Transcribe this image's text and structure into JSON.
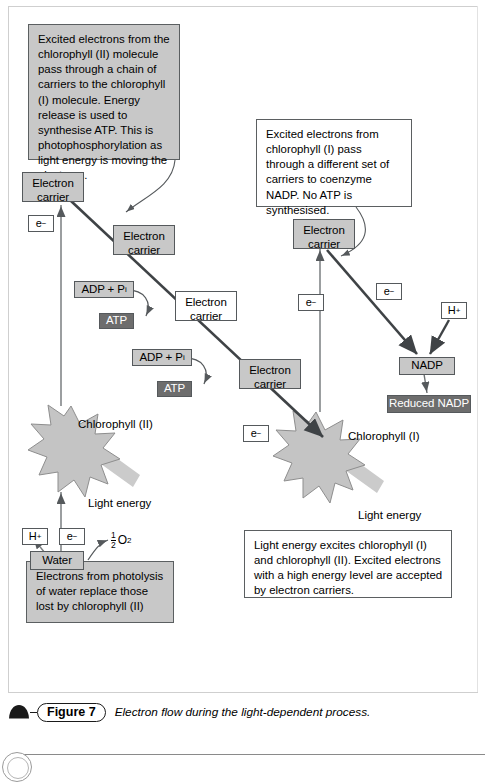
{
  "figure": {
    "number_label": "Figure 7",
    "caption": "Electron flow during the light-dependent process.",
    "icon": "arch-triangle-icon"
  },
  "notes": [
    {
      "id": "note-chlorophyll-2",
      "text": "Excited electrons from the chlorophyll (II) molecule pass through a chain of carriers to the chlorophyll (I) molecule. Energy release is used to synthesise ATP. This is photophosphorylation as light energy is moving the electrons.",
      "style": "gray"
    },
    {
      "id": "note-chlorophyll-1",
      "text": "Excited electrons from chlorophyll (I) pass through a different set of carriers to coenzyme NADP. No ATP is synthesised.",
      "style": "white"
    },
    {
      "id": "note-photolysis",
      "text": "Electrons from photolysis of water replace those lost by chlorophyll (II)",
      "style": "gray"
    },
    {
      "id": "note-light-energy",
      "text": "Light energy excites chlorophyll (I) and chlorophyll (II). Excited electrons with a high energy level are accepted by electron carriers.",
      "style": "white"
    }
  ],
  "carriers": [
    {
      "id": "carrier-left-top",
      "line1": "Electron",
      "line2": "carrier",
      "style": "gray"
    },
    {
      "id": "carrier-left-mid",
      "line1": "Electron",
      "line2": "carrier",
      "style": "gray"
    },
    {
      "id": "carrier-center-mid",
      "line1": "Electron",
      "line2": "carrier",
      "style": "white"
    },
    {
      "id": "carrier-center-low",
      "line1": "Electron",
      "line2": "carrier",
      "style": "gray"
    },
    {
      "id": "carrier-right-top",
      "line1": "Electron",
      "line2": "carrier",
      "style": "gray"
    }
  ],
  "molecules": {
    "adp_pi_upper": "ADP + P",
    "adp_pi_upper_sub": "i",
    "adp_pi_lower": "ADP + P",
    "adp_pi_lower_sub": "i",
    "atp_upper": "ATP",
    "atp_lower": "ATP",
    "nadp": "NADP",
    "reduced_nadp": "Reduced NADP",
    "water": "Water"
  },
  "ions": {
    "electron": "e",
    "electron_sup": "−",
    "proton": "H",
    "proton_sup": "+",
    "oxygen_num": "1",
    "oxygen_den": "2",
    "oxygen": "O",
    "oxygen_sub": "2"
  },
  "labels": {
    "chlorophyll_2": "Chlorophyll (II)",
    "chlorophyll_1": "Chlorophyll (I)",
    "light_energy_left": "Light energy",
    "light_energy_right": "Light energy"
  },
  "colors": {
    "box_gray": "#c8c8c8",
    "box_dark": "#6d6d6d",
    "star_fill": "#c4c4c4",
    "arrow_dark": "#3f4346",
    "light_arrow": "#c9c9c9",
    "border": "#55595c"
  }
}
